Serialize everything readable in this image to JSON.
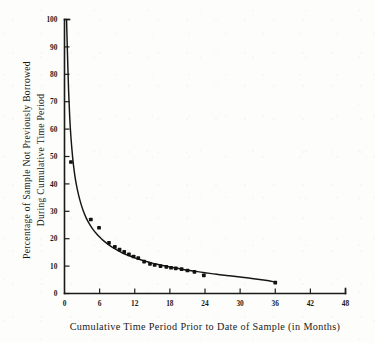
{
  "chart_data": {
    "type": "line",
    "title": "",
    "subtitle": "",
    "xlabel": "Cumulative Time Period Prior to Date of Sample  (in Months)",
    "ylabel": "Percentage of Sample Not Previously Borrowed During Cumulative Time Period",
    "ylabel_line1": "Percentage of Sample Not Previously Borrowed",
    "ylabel_line2": "During Cumulative Time Period",
    "xlim": [
      0,
      48
    ],
    "ylim": [
      0,
      100
    ],
    "xticks": [
      0,
      6,
      12,
      18,
      24,
      30,
      36,
      42,
      48
    ],
    "xticklabels": [
      "0",
      "6",
      "12",
      "18",
      "24",
      "30",
      "36",
      "42",
      "48"
    ],
    "yticks": [
      0,
      10,
      20,
      30,
      40,
      50,
      60,
      70,
      80,
      90,
      100
    ],
    "yticklabels": [
      "0",
      "10",
      "20",
      "30",
      "40",
      "50",
      "60",
      "70",
      "80",
      "90",
      "100"
    ],
    "grid": false,
    "legend": false,
    "legend_position": "none",
    "series": [
      {
        "name": "Fitted decay curve",
        "style": "line",
        "x": [
          0.35,
          0.5,
          0.7,
          0.9,
          1.1,
          1.4,
          1.7,
          2.0,
          2.4,
          2.8,
          3.2,
          3.7,
          4.2,
          4.8,
          5.4,
          6.0,
          6.7,
          7.4,
          8.2,
          9.0,
          10.0,
          11.0,
          12.0,
          13.0,
          14.0,
          15.0,
          16.0,
          17.0,
          18.0,
          19.0,
          20.0,
          21.0,
          22.0,
          23.0,
          24.0,
          26.0,
          28.0,
          30.0,
          32.0,
          34.0,
          36.0
        ],
        "y": [
          100.0,
          88.0,
          74.0,
          64.0,
          57.0,
          49.5,
          44.0,
          40.0,
          36.0,
          32.8,
          30.2,
          27.6,
          25.6,
          23.6,
          22.0,
          20.6,
          19.2,
          18.0,
          16.8,
          15.8,
          14.7,
          13.8,
          13.0,
          12.3,
          11.7,
          11.1,
          10.6,
          10.1,
          9.7,
          9.3,
          8.9,
          8.5,
          8.2,
          7.9,
          7.6,
          7.0,
          6.5,
          6.0,
          5.5,
          4.9,
          4.2
        ]
      },
      {
        "name": "Observed sample points",
        "style": "scatter",
        "x": [
          1.1,
          4.5,
          5.9,
          7.6,
          8.6,
          9.4,
          10.2,
          11.0,
          11.8,
          12.6,
          13.6,
          14.6,
          15.4,
          16.4,
          17.4,
          18.2,
          19.0,
          20.0,
          21.0,
          22.2,
          23.8,
          36.0
        ],
        "y": [
          48.0,
          27.0,
          24.0,
          18.5,
          17.0,
          16.0,
          15.2,
          14.3,
          13.5,
          12.9,
          11.6,
          10.8,
          10.4,
          10.0,
          9.7,
          9.4,
          9.2,
          8.9,
          8.4,
          7.9,
          6.6,
          4.0
        ]
      }
    ]
  }
}
